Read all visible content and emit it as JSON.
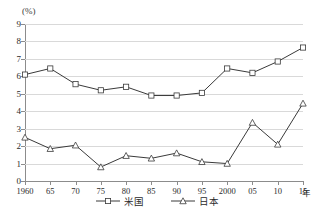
{
  "chart_data": {
    "type": "line",
    "title": "",
    "xlabel": "年",
    "ylabel": "(%)",
    "ylim": [
      0,
      9
    ],
    "grid": true,
    "legend_position": "bottom-center",
    "categories": [
      "1960",
      "65",
      "70",
      "75",
      "80",
      "85",
      "90",
      "95",
      "2000",
      "05",
      "10",
      "15"
    ],
    "ytick_labels": [
      "9",
      "8",
      "7",
      "6",
      "5",
      "4",
      "3",
      "2",
      "1",
      "0"
    ],
    "ytick_values": [
      9,
      8,
      7,
      6,
      5,
      4,
      3,
      2,
      1,
      0
    ],
    "series": [
      {
        "name": "米国",
        "marker": "square",
        "color": "#3a3a3a",
        "values": [
          6.1,
          6.45,
          5.55,
          5.2,
          5.4,
          4.9,
          4.9,
          5.05,
          6.45,
          6.2,
          6.85,
          7.65
        ]
      },
      {
        "name": "日本",
        "marker": "triangle",
        "color": "#3a3a3a",
        "values": [
          2.5,
          1.85,
          2.05,
          0.8,
          1.45,
          1.3,
          1.6,
          1.1,
          1.0,
          3.35,
          2.1,
          4.45
        ]
      }
    ]
  },
  "axis": {
    "y_unit_label": "(%)",
    "x_unit_label": "年"
  },
  "legend": {
    "items": [
      {
        "label": "米国"
      },
      {
        "label": "日本"
      }
    ]
  },
  "colors": {
    "line": "#3a3a3a",
    "grid": "#d9d9d9",
    "axis": "#8c8c8c",
    "marker_fill": "#ffffff",
    "text": "#2b2b2b"
  }
}
